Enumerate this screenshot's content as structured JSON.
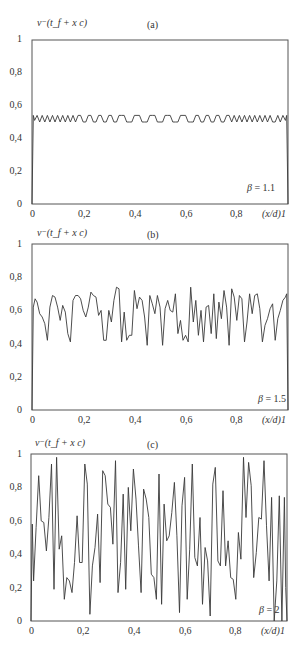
{
  "chart_data": [
    {
      "type": "line",
      "panel_label": "(a)",
      "ylabel": "v⁻(t_f + x c)",
      "xlabel": "(x/d)",
      "annotation": "β = 1.1",
      "beta": 1.1,
      "xlim": [
        0,
        1
      ],
      "ylim": [
        0,
        1
      ],
      "x_ticks": [
        "0",
        "0,2",
        "0,4",
        "0,6",
        "0,8",
        "1"
      ],
      "y_ticks": [
        "0",
        "0,2",
        "0,4",
        "0,6",
        "0,8",
        "1"
      ],
      "grid": false,
      "series": [
        {
          "name": "v-",
          "x": [
            0,
            0.005,
            0.01,
            0.02,
            0.03,
            0.04,
            0.05,
            0.06,
            0.07,
            0.08,
            0.09,
            0.1,
            0.11,
            0.12,
            0.13,
            0.14,
            0.15,
            0.16,
            0.17,
            0.18,
            0.19,
            0.2,
            0.21,
            0.22,
            0.23,
            0.24,
            0.25,
            0.26,
            0.27,
            0.28,
            0.29,
            0.3,
            0.31,
            0.32,
            0.33,
            0.34,
            0.35,
            0.36,
            0.37,
            0.38,
            0.39,
            0.4,
            0.41,
            0.42,
            0.43,
            0.44,
            0.45,
            0.46,
            0.47,
            0.48,
            0.49,
            0.5,
            0.51,
            0.52,
            0.53,
            0.54,
            0.55,
            0.56,
            0.57,
            0.58,
            0.59,
            0.6,
            0.61,
            0.62,
            0.63,
            0.64,
            0.65,
            0.66,
            0.67,
            0.68,
            0.69,
            0.7,
            0.71,
            0.72,
            0.73,
            0.74,
            0.75,
            0.76,
            0.77,
            0.78,
            0.79,
            0.8,
            0.81,
            0.82,
            0.83,
            0.84,
            0.85,
            0.86,
            0.87,
            0.88,
            0.89,
            0.9,
            0.91,
            0.92,
            0.93,
            0.94,
            0.95,
            0.96,
            0.97,
            0.98,
            0.99,
            0.995,
            1.0
          ],
          "y": [
            0,
            0.54,
            0.51,
            0.54,
            0.5,
            0.54,
            0.5,
            0.54,
            0.5,
            0.54,
            0.5,
            0.54,
            0.5,
            0.54,
            0.5,
            0.54,
            0.5,
            0.54,
            0.5,
            0.54,
            0.54,
            0.5,
            0.5,
            0.54,
            0.54,
            0.5,
            0.5,
            0.54,
            0.54,
            0.5,
            0.5,
            0.54,
            0.54,
            0.5,
            0.5,
            0.54,
            0.54,
            0.54,
            0.5,
            0.5,
            0.5,
            0.54,
            0.54,
            0.54,
            0.5,
            0.5,
            0.5,
            0.54,
            0.54,
            0.54,
            0.5,
            0.5,
            0.5,
            0.54,
            0.54,
            0.54,
            0.5,
            0.5,
            0.5,
            0.54,
            0.54,
            0.54,
            0.5,
            0.5,
            0.5,
            0.54,
            0.54,
            0.5,
            0.5,
            0.54,
            0.54,
            0.5,
            0.5,
            0.54,
            0.54,
            0.5,
            0.5,
            0.54,
            0.54,
            0.5,
            0.54,
            0.5,
            0.54,
            0.5,
            0.54,
            0.5,
            0.54,
            0.5,
            0.54,
            0.5,
            0.54,
            0.5,
            0.54,
            0.5,
            0.54,
            0.5,
            0.5,
            0.54,
            0.5,
            0.54,
            0.51,
            0.54,
            0
          ]
        }
      ]
    },
    {
      "type": "line",
      "panel_label": "(b)",
      "ylabel": "v⁻(t_f + x c)",
      "xlabel": "(x/d)",
      "annotation": "β = 1.5",
      "beta": 1.5,
      "xlim": [
        0,
        1
      ],
      "ylim": [
        0,
        1
      ],
      "x_ticks": [
        "0",
        "0,2",
        "0,4",
        "0,6",
        "0,8",
        "1"
      ],
      "y_ticks": [
        "0",
        "0,2",
        "0,4",
        "0,6",
        "0,8",
        "1"
      ],
      "grid": false,
      "series": [
        {
          "name": "v-",
          "x": [
            0,
            0.005,
            0.012,
            0.02,
            0.03,
            0.04,
            0.05,
            0.06,
            0.07,
            0.08,
            0.09,
            0.1,
            0.11,
            0.12,
            0.13,
            0.14,
            0.15,
            0.16,
            0.17,
            0.18,
            0.19,
            0.2,
            0.21,
            0.22,
            0.23,
            0.24,
            0.25,
            0.26,
            0.27,
            0.28,
            0.29,
            0.3,
            0.31,
            0.32,
            0.33,
            0.34,
            0.35,
            0.36,
            0.37,
            0.38,
            0.39,
            0.4,
            0.41,
            0.42,
            0.43,
            0.44,
            0.45,
            0.46,
            0.47,
            0.48,
            0.49,
            0.5,
            0.51,
            0.52,
            0.53,
            0.54,
            0.55,
            0.56,
            0.57,
            0.58,
            0.59,
            0.6,
            0.61,
            0.62,
            0.63,
            0.64,
            0.65,
            0.66,
            0.67,
            0.68,
            0.69,
            0.7,
            0.71,
            0.72,
            0.73,
            0.74,
            0.75,
            0.76,
            0.77,
            0.78,
            0.79,
            0.8,
            0.81,
            0.82,
            0.83,
            0.84,
            0.85,
            0.86,
            0.87,
            0.88,
            0.89,
            0.9,
            0.91,
            0.92,
            0.93,
            0.94,
            0.95,
            0.96,
            0.97,
            0.98,
            0.99,
            0.995,
            1.0
          ],
          "y": [
            0,
            0.62,
            0.67,
            0.65,
            0.58,
            0.56,
            0.52,
            0.42,
            0.62,
            0.69,
            0.68,
            0.62,
            0.54,
            0.63,
            0.59,
            0.46,
            0.41,
            0.66,
            0.69,
            0.69,
            0.67,
            0.6,
            0.56,
            0.62,
            0.71,
            0.69,
            0.68,
            0.57,
            0.6,
            0.42,
            0.42,
            0.6,
            0.53,
            0.66,
            0.74,
            0.73,
            0.41,
            0.59,
            0.42,
            0.45,
            0.45,
            0.72,
            0.61,
            0.68,
            0.66,
            0.56,
            0.39,
            0.69,
            0.64,
            0.58,
            0.69,
            0.62,
            0.39,
            0.61,
            0.66,
            0.6,
            0.59,
            0.7,
            0.46,
            0.54,
            0.42,
            0.45,
            0.41,
            0.74,
            0.53,
            0.66,
            0.45,
            0.6,
            0.41,
            0.62,
            0.63,
            0.46,
            0.7,
            0.43,
            0.65,
            0.55,
            0.72,
            0.62,
            0.39,
            0.73,
            0.68,
            0.54,
            0.69,
            0.67,
            0.41,
            0.53,
            0.7,
            0.58,
            0.69,
            0.7,
            0.61,
            0.41,
            0.51,
            0.55,
            0.61,
            0.64,
            0.42,
            0.55,
            0.6,
            0.66,
            0.68,
            0.7,
            0
          ]
        }
      ]
    },
    {
      "type": "line",
      "panel_label": "(c)",
      "ylabel": "v⁻(t_f + x c)",
      "xlabel": "(x/d)",
      "annotation": "β = 2",
      "beta": 2,
      "xlim": [
        0,
        1
      ],
      "ylim": [
        0,
        1
      ],
      "x_ticks": [
        "0",
        "0,2",
        "0,4",
        "0,6",
        "0,8",
        "1"
      ],
      "y_ticks": [
        "0",
        "0,2",
        "0,4",
        "0,6",
        "0,8",
        "1"
      ],
      "grid": false,
      "series": [
        {
          "name": "v-",
          "x": [
            0,
            0.005,
            0.01,
            0.02,
            0.03,
            0.04,
            0.05,
            0.06,
            0.07,
            0.08,
            0.09,
            0.1,
            0.11,
            0.12,
            0.13,
            0.14,
            0.15,
            0.16,
            0.17,
            0.18,
            0.19,
            0.2,
            0.21,
            0.22,
            0.23,
            0.24,
            0.25,
            0.26,
            0.27,
            0.28,
            0.29,
            0.3,
            0.31,
            0.32,
            0.33,
            0.34,
            0.35,
            0.36,
            0.37,
            0.38,
            0.39,
            0.4,
            0.41,
            0.42,
            0.43,
            0.44,
            0.45,
            0.46,
            0.47,
            0.48,
            0.49,
            0.5,
            0.51,
            0.52,
            0.53,
            0.54,
            0.55,
            0.56,
            0.57,
            0.58,
            0.59,
            0.6,
            0.61,
            0.62,
            0.63,
            0.64,
            0.65,
            0.66,
            0.67,
            0.68,
            0.69,
            0.7,
            0.71,
            0.72,
            0.73,
            0.74,
            0.75,
            0.76,
            0.77,
            0.78,
            0.79,
            0.8,
            0.81,
            0.82,
            0.83,
            0.84,
            0.85,
            0.86,
            0.87,
            0.88,
            0.89,
            0.9,
            0.91,
            0.92,
            0.93,
            0.94,
            0.95,
            0.96,
            0.97,
            0.98,
            0.99,
            0.995,
            1.0
          ],
          "y": [
            0,
            0.58,
            0.24,
            0.56,
            0.87,
            0.6,
            0.59,
            0.42,
            0.62,
            0.94,
            0.19,
            0.98,
            0.43,
            0.51,
            0.13,
            0.26,
            0.24,
            0.17,
            0.35,
            0.63,
            0.35,
            0.35,
            0.94,
            0.82,
            0.04,
            0.33,
            0.44,
            0.64,
            0.23,
            0.9,
            0.87,
            0.7,
            0.68,
            0.46,
            0.96,
            0.17,
            0.35,
            0.76,
            0.19,
            0.8,
            0.54,
            0.91,
            0.73,
            0.45,
            0.17,
            0.79,
            0.73,
            0.62,
            0.28,
            0.26,
            0.13,
            0.88,
            0.1,
            0.7,
            0.48,
            0.51,
            0.65,
            0.83,
            0.51,
            0.05,
            0.69,
            0.86,
            0.13,
            0.43,
            0.94,
            0.38,
            0.33,
            0.62,
            0.1,
            0.44,
            0.36,
            0.03,
            0.82,
            0.92,
            0.36,
            0.33,
            0.78,
            0.33,
            0.48,
            0.26,
            0.25,
            0.13,
            0.53,
            0.37,
            0.98,
            0.62,
            0.95,
            0.81,
            0.26,
            0.41,
            0.62,
            0.61,
            0.96,
            0.57,
            0.24,
            0.74,
            0.0,
            0.24,
            0.75,
            0.0,
            0.74,
            0.2,
            0
          ]
        }
      ]
    }
  ],
  "panels": [
    {
      "title_fn": "v⁻(t_f + x   c)",
      "tag": "(a)",
      "beta_sym": "β",
      "beta_val": "= 1.1",
      "xaxis_name": "(x/d)1"
    },
    {
      "title_fn": "v⁻(t_f + x   c)",
      "tag": "(b)",
      "beta_sym": "β",
      "beta_val": "= 1.5",
      "xaxis_name": "(x/d)1"
    },
    {
      "title_fn": "v⁻(t_f + x   c)",
      "tag": "(c)",
      "beta_sym": "β",
      "beta_val": "= 2",
      "xaxis_name": "(x/d)1"
    }
  ],
  "axis": {
    "y_ticks": [
      "1",
      "0,8",
      "0,6",
      "0,4",
      "0,2",
      "0"
    ],
    "x_ticks": [
      "0",
      "0,2",
      "0,4",
      "0,6",
      "0,8"
    ]
  },
  "style": {
    "line_color": "#3a3a3a",
    "frame_color": "#555555"
  }
}
